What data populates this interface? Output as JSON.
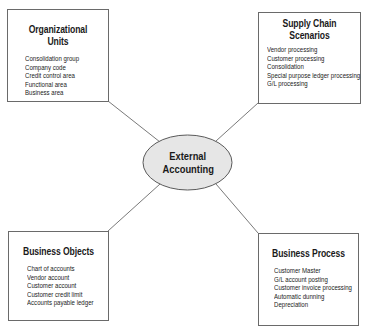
{
  "center": {
    "label_line1": "External",
    "label_line2": "Accounting",
    "fill": "#e6e6e6"
  },
  "boxes": {
    "org_units": {
      "title": "Organizational Units",
      "items": [
        "Consolidation group",
        "Company code",
        "Credit control area",
        "Functional area",
        "Business area"
      ]
    },
    "supply_chain": {
      "title_line1": "Supply Chain",
      "title_line2": "Scenarios",
      "items": [
        "Vendor processing",
        "Customer processing",
        "Consolidation",
        "Special purpose ledger processing",
        "G/L processing"
      ]
    },
    "business_objects": {
      "title": "Business Objects",
      "items": [
        "Chart of accounts",
        "Vendor account",
        "Customer account",
        "Customer credit limit",
        "Accounts payable ledger"
      ]
    },
    "business_process": {
      "title": "Business Process",
      "items": [
        "Customer Master",
        "G/L account posting",
        "Customer invoice processing",
        "Automatic dunning",
        "Depreciation"
      ]
    }
  }
}
